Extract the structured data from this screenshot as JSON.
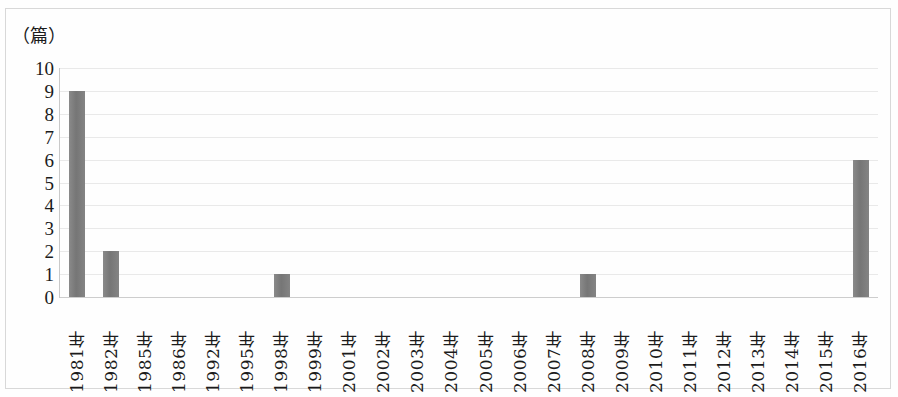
{
  "chart_data": {
    "type": "bar",
    "title": "",
    "subtitle": "",
    "xlabel": "",
    "ylabel": "（篇）",
    "unit_label": "（篇）",
    "ylim": [
      0,
      10
    ],
    "ytick_step": 1,
    "grid": true,
    "legend": null,
    "legend_position": "none",
    "bar_color": "#7e7e7e",
    "gridline_color": "#e9e9e9",
    "axis_color": "#c9c9c9",
    "yticks": [
      "10",
      "9",
      "8",
      "7",
      "6",
      "5",
      "4",
      "3",
      "2",
      "1",
      "0"
    ],
    "categories": [
      "1981年",
      "1982年",
      "1985年",
      "1986年",
      "1992年",
      "1995年",
      "1998年",
      "1999年",
      "2001年",
      "2002年",
      "2003年",
      "2004年",
      "2005年",
      "2006年",
      "2007年",
      "2008年",
      "2009年",
      "2010年",
      "2011年",
      "2012年",
      "2013年",
      "2014年",
      "2015年",
      "2016年"
    ],
    "values": [
      9,
      2,
      0,
      0,
      0,
      0,
      1,
      0,
      0,
      0,
      0,
      0,
      0,
      0,
      0,
      1,
      0,
      0,
      0,
      0,
      0,
      0,
      0,
      6
    ]
  }
}
